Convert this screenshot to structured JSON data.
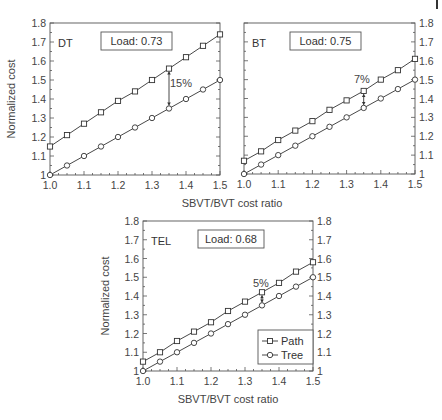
{
  "chart_data": [
    {
      "type": "line",
      "panel": "DT",
      "load_label": "Load: 0.73",
      "x": [
        1.0,
        1.05,
        1.1,
        1.15,
        1.2,
        1.25,
        1.3,
        1.35,
        1.4,
        1.45,
        1.5
      ],
      "series": [
        {
          "name": "Path",
          "marker": "square",
          "values": [
            1.15,
            1.21,
            1.27,
            1.33,
            1.39,
            1.44,
            1.5,
            1.56,
            1.62,
            1.68,
            1.74
          ]
        },
        {
          "name": "Tree",
          "marker": "circle",
          "values": [
            1.0,
            1.05,
            1.1,
            1.15,
            1.2,
            1.25,
            1.3,
            1.35,
            1.4,
            1.45,
            1.5
          ]
        }
      ],
      "annotation": {
        "text": "15%",
        "x": 1.35
      },
      "xlabel": "SBVT/BVT cost ratio",
      "ylabel": "Normalized cost",
      "xlim": [
        1.0,
        1.5
      ],
      "ylim": [
        1.0,
        1.8
      ],
      "xticks": [
        "1.0",
        "1.1",
        "1.2",
        "1.3",
        "1.4",
        "1.5"
      ],
      "yticks": [
        "1",
        "1.1",
        "1.2",
        "1.3",
        "1.4",
        "1.5",
        "1.6",
        "1.7",
        "1.8"
      ],
      "y_axis_side": "left"
    },
    {
      "type": "line",
      "panel": "BT",
      "load_label": "Load: 0.75",
      "x": [
        1.0,
        1.05,
        1.1,
        1.15,
        1.2,
        1.25,
        1.3,
        1.35,
        1.4,
        1.45,
        1.5
      ],
      "series": [
        {
          "name": "Path",
          "marker": "square",
          "values": [
            1.07,
            1.12,
            1.18,
            1.23,
            1.28,
            1.34,
            1.39,
            1.44,
            1.5,
            1.55,
            1.61
          ]
        },
        {
          "name": "Tree",
          "marker": "circle",
          "values": [
            1.0,
            1.05,
            1.1,
            1.15,
            1.2,
            1.25,
            1.3,
            1.35,
            1.4,
            1.45,
            1.5
          ]
        }
      ],
      "annotation": {
        "text": "7%",
        "x": 1.35
      },
      "xlabel": "",
      "ylabel": "",
      "xlim": [
        1.0,
        1.5
      ],
      "ylim": [
        1.0,
        1.8
      ],
      "xticks": [
        "1.0",
        "1.1",
        "1.2",
        "1.3",
        "1.4",
        "1.5"
      ],
      "yticks": [
        "1",
        "1.1",
        "1.2",
        "1.3",
        "1.4",
        "1.5",
        "1.6",
        "1.7",
        "1.8"
      ],
      "y_axis_side": "right"
    },
    {
      "type": "line",
      "panel": "TEL",
      "load_label": "Load: 0.68",
      "x": [
        1.0,
        1.05,
        1.1,
        1.15,
        1.2,
        1.25,
        1.3,
        1.35,
        1.4,
        1.45,
        1.5
      ],
      "series": [
        {
          "name": "Path",
          "marker": "square",
          "values": [
            1.05,
            1.1,
            1.16,
            1.21,
            1.26,
            1.32,
            1.37,
            1.42,
            1.47,
            1.53,
            1.58
          ]
        },
        {
          "name": "Tree",
          "marker": "circle",
          "values": [
            1.0,
            1.05,
            1.1,
            1.15,
            1.2,
            1.25,
            1.3,
            1.35,
            1.4,
            1.45,
            1.5
          ]
        }
      ],
      "annotation": {
        "text": "5%",
        "x": 1.35
      },
      "xlabel": "SBVT/BVT cost ratio",
      "ylabel": "Normalized cost",
      "xlim": [
        1.0,
        1.5
      ],
      "ylim": [
        1.0,
        1.8
      ],
      "xticks": [
        "1.0",
        "1.1",
        "1.2",
        "1.3",
        "1.4",
        "1.5"
      ],
      "yticks": [
        "1",
        "1.1",
        "1.2",
        "1.3",
        "1.4",
        "1.5",
        "1.6",
        "1.7",
        "1.8"
      ],
      "y_axis_side": "both",
      "legend": {
        "position": "lower right",
        "entries": [
          "Path",
          "Tree"
        ]
      }
    }
  ],
  "panels": {
    "dt": {
      "label": "DT",
      "load": "Load: 0.73",
      "annotation": "15%"
    },
    "bt": {
      "label": "BT",
      "load": "Load: 0.75",
      "annotation": "7%"
    },
    "tel": {
      "label": "TEL",
      "load": "Load: 0.68",
      "annotation": "5%"
    }
  },
  "axes": {
    "xlabel": "SBVT/BVT cost ratio",
    "ylabel": "Normalized cost"
  },
  "legend": {
    "path": "Path",
    "tree": "Tree"
  }
}
